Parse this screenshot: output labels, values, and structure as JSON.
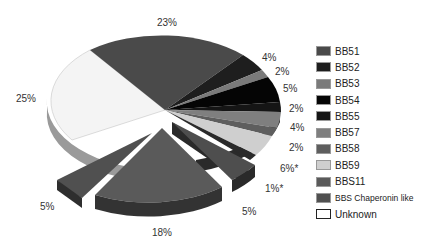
{
  "chart_data": {
    "type": "pie",
    "title": "",
    "style": "3d-exploded",
    "legend_position": "right",
    "slices": [
      {
        "label": "BB51",
        "value": 23,
        "text": "23%",
        "color": "#4a4a4a"
      },
      {
        "label": "BB52",
        "value": 4,
        "text": "4%",
        "color": "#1e1e1e"
      },
      {
        "label": "BB53",
        "value": 2,
        "text": "2%",
        "color": "#7a7a7a"
      },
      {
        "label": "BB54",
        "value": 5,
        "text": "5%",
        "color": "#050505"
      },
      {
        "label": "BB55",
        "value": 2,
        "text": "2%",
        "color": "#151515"
      },
      {
        "label": "BB57",
        "value": 4,
        "text": "4%",
        "color": "#7f7f7f"
      },
      {
        "label": "BB58",
        "value": 2,
        "text": "2%",
        "color": "#5e5e5e"
      },
      {
        "label": "BB59",
        "value": 6,
        "text": "6%*",
        "color": "#cfcfcf"
      },
      {
        "label": "BB59 (unlabeled)",
        "value": 1,
        "text": "1%*",
        "color": "#2a2a2a"
      },
      {
        "label": "BBS Chaperonin like",
        "value": 5,
        "text": "5%",
        "color": "#505050",
        "exploded": true
      },
      {
        "label": "BBS11",
        "value": 18,
        "text": "18%",
        "color": "#5a5a5a",
        "exploded": true
      },
      {
        "label": "BBS Chaperonin like",
        "value": 5,
        "text": "5%",
        "color": "#505050",
        "exploded": true
      },
      {
        "label": "Unknown",
        "value": 25,
        "text": "25%",
        "color": "#f4f4f4"
      }
    ]
  },
  "labels": {
    "p23": "23%",
    "p4a": "4%",
    "p2a": "2%",
    "p5a": "5%",
    "p2b": "2%",
    "p4b": "4%",
    "p2c": "2%",
    "p6": "6%*",
    "p1": "1%*",
    "p5b": "5%",
    "p18": "18%",
    "p5c": "5%",
    "p25": "25%"
  },
  "legend": [
    {
      "label": "BB51",
      "color": "#4a4a4a"
    },
    {
      "label": "BB52",
      "color": "#1e1e1e"
    },
    {
      "label": "BB53",
      "color": "#7a7a7a"
    },
    {
      "label": "BB54",
      "color": "#050505"
    },
    {
      "label": "BB55",
      "color": "#151515"
    },
    {
      "label": "BB57",
      "color": "#7f7f7f"
    },
    {
      "label": "BB58",
      "color": "#5e5e5e"
    },
    {
      "label": "BB59",
      "color": "#cfcfcf"
    },
    {
      "label": "BBS11",
      "color": "#5a5a5a"
    },
    {
      "label": "BBS Chaperonin like",
      "color": "#505050"
    },
    {
      "label": "Unknown",
      "color": "#ffffff"
    }
  ]
}
